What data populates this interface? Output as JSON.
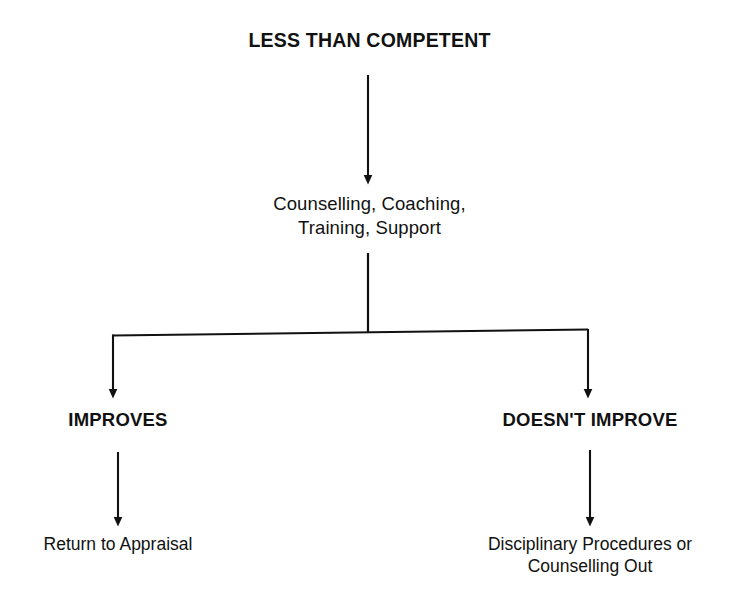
{
  "diagram": {
    "background_color": "#ffffff",
    "line_color": "#111111",
    "text_color": "#111111",
    "nodes": {
      "root": {
        "label": "LESS THAN COMPETENT"
      },
      "intervention": {
        "line1": "Counselling, Coaching,",
        "line2": "Training, Support"
      },
      "branch_left": {
        "label": "IMPROVES"
      },
      "branch_right": {
        "label": "DOESN'T IMPROVE"
      },
      "outcome_left": {
        "label": "Return to Appraisal"
      },
      "outcome_right": {
        "line1": "Disciplinary Procedures or",
        "line2": "Counselling Out"
      }
    },
    "connectors": [
      {
        "name": "root-to-intervention",
        "type": "arrow-down"
      },
      {
        "name": "intervention-to-split",
        "type": "line-down"
      },
      {
        "name": "split-bar",
        "type": "horizontal-bar"
      },
      {
        "name": "split-to-improves",
        "type": "arrow-down"
      },
      {
        "name": "split-to-doesnt-improve",
        "type": "arrow-down"
      },
      {
        "name": "improves-to-return-appraisal",
        "type": "arrow-down"
      },
      {
        "name": "doesnt-improve-to-disciplinary",
        "type": "arrow-down"
      }
    ]
  }
}
